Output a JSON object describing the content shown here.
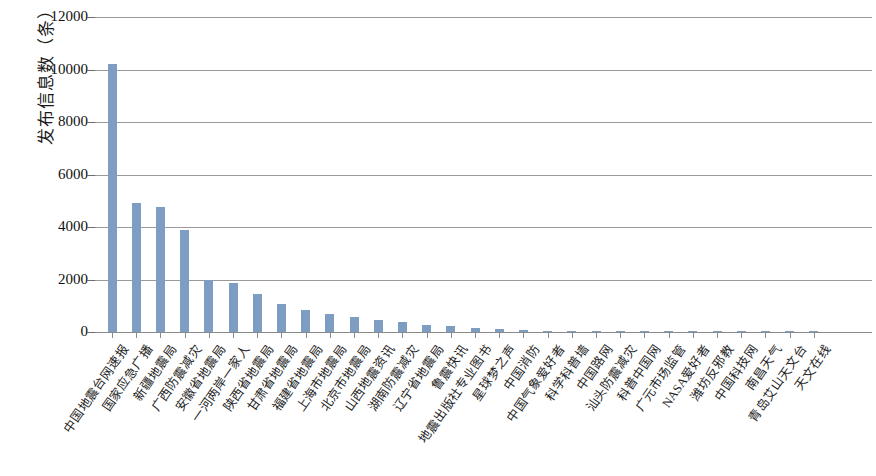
{
  "chart_data": {
    "type": "bar",
    "title": "",
    "xlabel": "",
    "ylabel": "发布信息数（条）",
    "ylim": [
      0,
      12000
    ],
    "ytick_labels": [
      "12000",
      "10000",
      "8000",
      "6000",
      "4000",
      "2000",
      "0"
    ],
    "ytick_values": [
      12000,
      10000,
      8000,
      6000,
      4000,
      2000,
      0
    ],
    "grid": true,
    "legend": "none",
    "bar_color": "#7e9dc2",
    "categories": [
      "中国地震台网速报",
      "国家应急广播",
      "新疆地震局",
      "广西防震减灾",
      "安徽省地震局",
      "一河两岸一家人",
      "陕西省地震局",
      "甘肃省地震局",
      "福建省地震局",
      "上海市地震局",
      "北京市地震局",
      "山西地震资讯",
      "湖南防震减灾",
      "辽宁省地震局",
      "鲁震快讯",
      "地震出版社专业图书",
      "星球梦之声",
      "中国消防",
      "中国气象爱好者",
      "科学科普墙",
      "中国路网",
      "汕头防震减灾",
      "科普中国网",
      "广元市场监管",
      "NASA爱好者",
      "潍坊反邪教",
      "中国科技网",
      "南昌天气",
      "青岛艾山天文台",
      "天文在线"
    ],
    "values": [
      10200,
      4900,
      4750,
      3880,
      2000,
      1850,
      1450,
      1050,
      830,
      700,
      570,
      460,
      380,
      250,
      230,
      140,
      100,
      60,
      45,
      35,
      28,
      22,
      18,
      14,
      11,
      9,
      7,
      5,
      4,
      3
    ]
  }
}
